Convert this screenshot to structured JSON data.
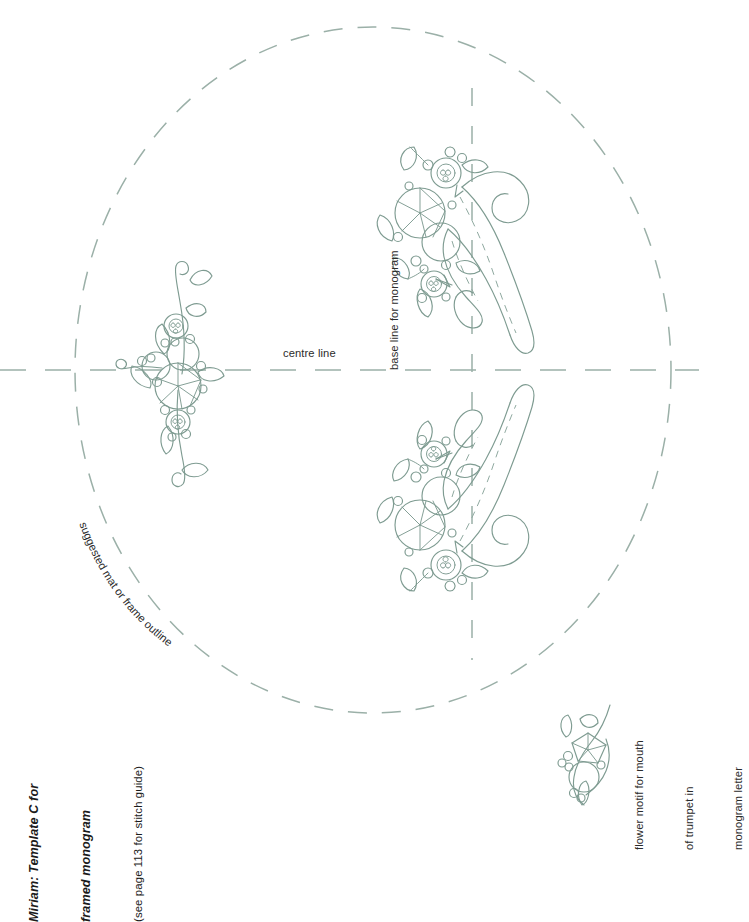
{
  "page": {
    "width": 699,
    "height": 871,
    "background": "#ffffff",
    "line_color": "#7e9b91",
    "guide_color": "#9bb0a8",
    "text_color": "#2b2b2b"
  },
  "title": {
    "line1": "Miriam: Template C for",
    "line2": "framed monogram",
    "subtitle": "(see page 113 for stitch guide)"
  },
  "labels": {
    "centre_line": "centre line",
    "base_line": "base line for monogram",
    "mat_outline": "suggested mat or frame outline"
  },
  "flower_caption": {
    "line1": "flower motif for mouth",
    "line2": "of trumpet in",
    "line3": "monogram letter"
  },
  "guides": {
    "ellipse": {
      "cx": 373,
      "cy": 370,
      "rx": 298,
      "ry": 343
    },
    "centre_line_y": 370,
    "base_line_x": 472
  },
  "motifs": [
    {
      "name": "trumpet-motif-top",
      "x": 400,
      "y": 145
    },
    {
      "name": "trumpet-motif-bottom",
      "x": 400,
      "y": 395
    },
    {
      "name": "side-flower-motif",
      "x": 120,
      "y": 258
    },
    {
      "name": "flower-motif-detail",
      "x": 558,
      "y": 705
    }
  ]
}
